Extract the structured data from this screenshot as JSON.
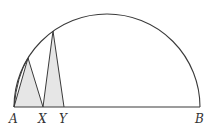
{
  "diagram": {
    "type": "geometry-semicircle",
    "colors": {
      "stroke": "#3a3a3a",
      "fill": "#e6e6e6",
      "label": "#333333",
      "background": "#ffffff"
    },
    "semicircle": {
      "center": [
        107,
        107
      ],
      "radius": 93
    },
    "points": {
      "A": {
        "label": "A",
        "x": 14,
        "y": 107
      },
      "X": {
        "label": "X",
        "x": 43,
        "y": 107
      },
      "Y": {
        "label": "Y",
        "x": 64,
        "y": 107
      },
      "B": {
        "label": "B",
        "x": 200,
        "y": 107
      },
      "P": {
        "x": 28,
        "y": 58
      },
      "Q": {
        "x": 53,
        "y": 31
      }
    },
    "triangles": [
      {
        "name": "APX",
        "vertices": [
          "A",
          "P",
          "X"
        ],
        "shaded": true
      },
      {
        "name": "XQY",
        "vertices": [
          "X",
          "Q",
          "Y"
        ],
        "shaded": true
      }
    ]
  }
}
